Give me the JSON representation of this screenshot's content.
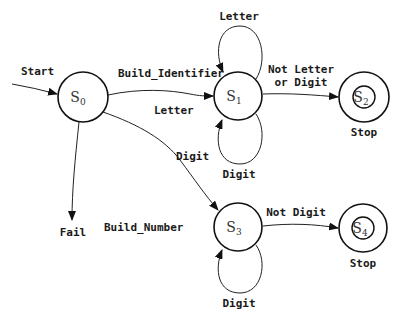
{
  "diagram": {
    "type": "state-machine",
    "states": [
      {
        "id": "S0",
        "label": "S",
        "sub": "0",
        "accepting": false
      },
      {
        "id": "S1",
        "label": "S",
        "sub": "1",
        "accepting": false
      },
      {
        "id": "S2",
        "label": "S",
        "sub": "2",
        "accepting": true,
        "caption": "Stop"
      },
      {
        "id": "S3",
        "label": "S",
        "sub": "3",
        "accepting": false
      },
      {
        "id": "S4",
        "label": "S",
        "sub": "4",
        "accepting": true,
        "caption": "Stop"
      }
    ],
    "transitions": [
      {
        "from": "start",
        "to": "S0",
        "label": "Start"
      },
      {
        "from": "S0",
        "to": "S1",
        "label": "Letter",
        "action": "Build_Identifier"
      },
      {
        "from": "S1",
        "to": "S1",
        "label": "Letter",
        "position": "top"
      },
      {
        "from": "S1",
        "to": "S1",
        "label": "Digit",
        "position": "bottom"
      },
      {
        "from": "S1",
        "to": "S2",
        "label_line1": "Not Letter",
        "label_line2": "or Digit"
      },
      {
        "from": "S0",
        "to": "S3",
        "label": "Digit",
        "action": "Build_Number"
      },
      {
        "from": "S3",
        "to": "S3",
        "label": "Digit",
        "position": "bottom"
      },
      {
        "from": "S3",
        "to": "S4",
        "label": "Not Digit"
      },
      {
        "from": "S0",
        "to": "fail",
        "label": "Fail"
      }
    ]
  }
}
